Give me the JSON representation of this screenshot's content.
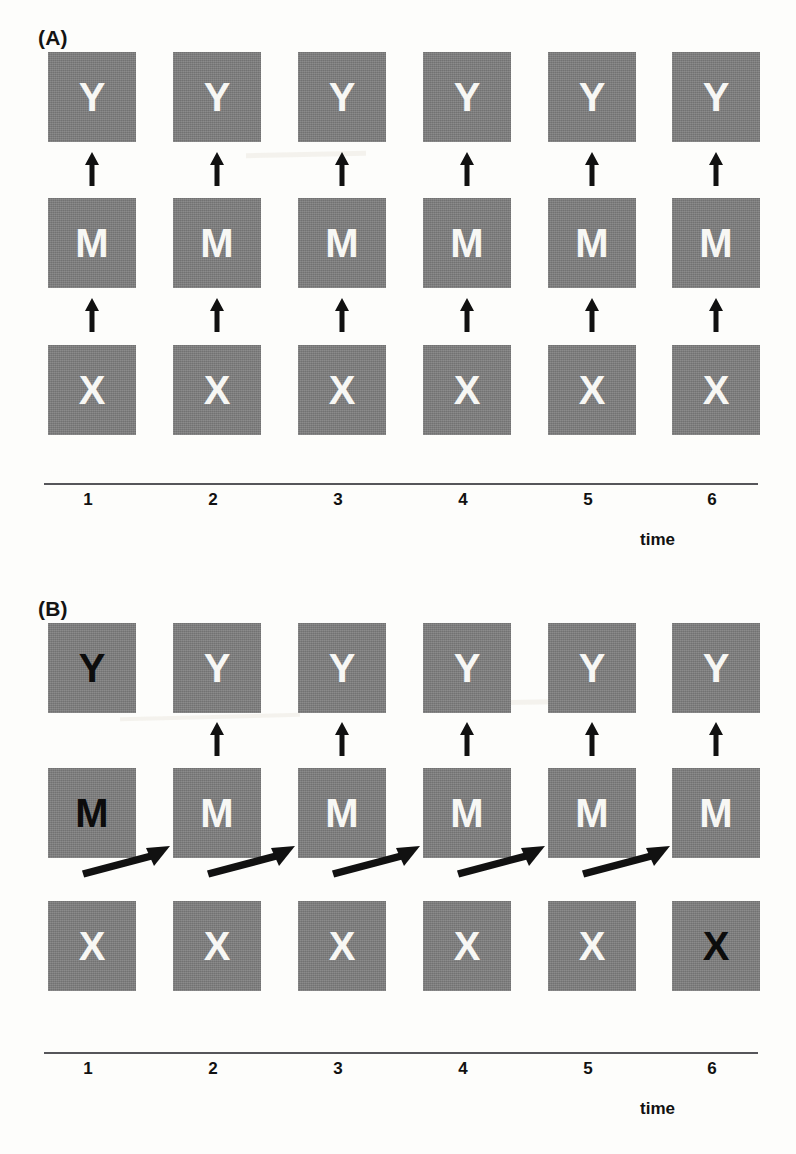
{
  "figure": {
    "background_color": "#fdfdfb",
    "node_fill_color": "#7d7d7d",
    "light_glyph_color": "#f7f7f4",
    "dark_glyph_color": "#0c0c0c",
    "arrow_color": "#111111",
    "axis_color": "#56565a"
  },
  "panels": [
    {
      "id": "A",
      "label": "(A)",
      "rows": [
        {
          "name": "row-y",
          "nodes": [
            {
              "label": "Y",
              "glyph_style": "light"
            },
            {
              "label": "Y",
              "glyph_style": "light"
            },
            {
              "label": "Y",
              "glyph_style": "light"
            },
            {
              "label": "Y",
              "glyph_style": "light"
            },
            {
              "label": "Y",
              "glyph_style": "light"
            },
            {
              "label": "Y",
              "glyph_style": "light"
            }
          ]
        },
        {
          "name": "row-m",
          "nodes": [
            {
              "label": "M",
              "glyph_style": "light"
            },
            {
              "label": "M",
              "glyph_style": "light"
            },
            {
              "label": "M",
              "glyph_style": "light"
            },
            {
              "label": "M",
              "glyph_style": "light"
            },
            {
              "label": "M",
              "glyph_style": "light"
            },
            {
              "label": "M",
              "glyph_style": "light"
            }
          ]
        },
        {
          "name": "row-x",
          "nodes": [
            {
              "label": "X",
              "glyph_style": "light"
            },
            {
              "label": "X",
              "glyph_style": "light"
            },
            {
              "label": "X",
              "glyph_style": "light"
            },
            {
              "label": "X",
              "glyph_style": "light"
            },
            {
              "label": "X",
              "glyph_style": "light"
            },
            {
              "label": "X",
              "glyph_style": "light"
            }
          ]
        }
      ],
      "vertical_arrows_m_to_y": [
        1,
        2,
        3,
        4,
        5,
        6
      ],
      "vertical_arrows_x_to_m": [
        1,
        2,
        3,
        4,
        5,
        6
      ],
      "diagonal_arrows": [],
      "axis": {
        "tick_labels": [
          "1",
          "2",
          "3",
          "4",
          "5",
          "6"
        ],
        "title": "time"
      }
    },
    {
      "id": "B",
      "label": "(B)",
      "rows": [
        {
          "name": "row-y",
          "nodes": [
            {
              "label": "Y",
              "glyph_style": "dark"
            },
            {
              "label": "Y",
              "glyph_style": "light"
            },
            {
              "label": "Y",
              "glyph_style": "light"
            },
            {
              "label": "Y",
              "glyph_style": "light"
            },
            {
              "label": "Y",
              "glyph_style": "light"
            },
            {
              "label": "Y",
              "glyph_style": "light"
            }
          ]
        },
        {
          "name": "row-m",
          "nodes": [
            {
              "label": "M",
              "glyph_style": "dark"
            },
            {
              "label": "M",
              "glyph_style": "light"
            },
            {
              "label": "M",
              "glyph_style": "light"
            },
            {
              "label": "M",
              "glyph_style": "light"
            },
            {
              "label": "M",
              "glyph_style": "light"
            },
            {
              "label": "M",
              "glyph_style": "light"
            }
          ]
        },
        {
          "name": "row-x",
          "nodes": [
            {
              "label": "X",
              "glyph_style": "light"
            },
            {
              "label": "X",
              "glyph_style": "light"
            },
            {
              "label": "X",
              "glyph_style": "light"
            },
            {
              "label": "X",
              "glyph_style": "light"
            },
            {
              "label": "X",
              "glyph_style": "light"
            },
            {
              "label": "X",
              "glyph_style": "dark"
            }
          ]
        }
      ],
      "vertical_arrows_m_to_y": [
        2,
        3,
        4,
        5,
        6
      ],
      "vertical_arrows_x_to_m": [],
      "diagonal_arrows": [
        {
          "from_column": 1,
          "to_column": 2
        },
        {
          "from_column": 2,
          "to_column": 3
        },
        {
          "from_column": 3,
          "to_column": 4
        },
        {
          "from_column": 4,
          "to_column": 5
        },
        {
          "from_column": 5,
          "to_column": 6
        }
      ],
      "axis": {
        "tick_labels": [
          "1",
          "2",
          "3",
          "4",
          "5",
          "6"
        ],
        "title": "time"
      }
    }
  ]
}
